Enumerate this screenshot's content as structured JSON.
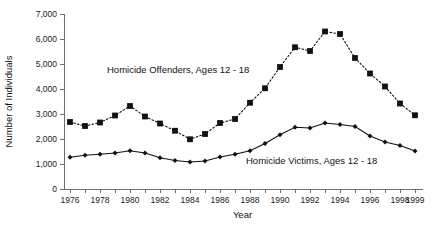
{
  "chart_data": {
    "type": "line",
    "title": "",
    "xlabel": "Year",
    "ylabel": "Number of Individuals",
    "xlim": [
      1976,
      1999
    ],
    "ylim": [
      0,
      7000
    ],
    "grid": false,
    "legend_position": "inline-annotation",
    "x": [
      1976,
      1977,
      1978,
      1979,
      1980,
      1981,
      1982,
      1983,
      1984,
      1985,
      1986,
      1987,
      1988,
      1989,
      1990,
      1991,
      1992,
      1993,
      1994,
      1995,
      1996,
      1997,
      1998,
      1999
    ],
    "x_tick_labels": [
      "1976",
      "1978",
      "1980",
      "1982",
      "1984",
      "1986",
      "1988",
      "1990",
      "1992",
      "1994",
      "1996",
      "1998",
      "1999"
    ],
    "x_ticks": [
      1976,
      1978,
      1980,
      1982,
      1984,
      1986,
      1988,
      1990,
      1992,
      1994,
      1996,
      1998,
      1999
    ],
    "y_ticks": [
      0,
      1000,
      2000,
      3000,
      4000,
      5000,
      6000,
      7000
    ],
    "y_tick_labels": [
      "0",
      "1,000",
      "2,000",
      "3,000",
      "4,000",
      "5,000",
      "6,000",
      "7,000"
    ],
    "series": [
      {
        "name": "Homicide Offenders, Ages 12 - 18",
        "marker": "square",
        "linestyle": "dotted",
        "color": "#111111",
        "annotation": "Homicide Offenders, Ages 12 - 18",
        "values": [
          2680,
          2520,
          2660,
          2940,
          3320,
          2900,
          2620,
          2330,
          1990,
          2200,
          2640,
          2800,
          3450,
          4030,
          4880,
          5670,
          5520,
          6300,
          6200,
          5240,
          4620,
          4100,
          3420,
          2950
        ]
      },
      {
        "name": "Homicide Victims, Ages 12 - 18",
        "marker": "diamond",
        "linestyle": "solid",
        "color": "#111111",
        "annotation": "Homicide Victims, Ages 12 - 18",
        "values": [
          1270,
          1350,
          1390,
          1440,
          1530,
          1440,
          1250,
          1140,
          1080,
          1120,
          1280,
          1390,
          1530,
          1820,
          2170,
          2470,
          2440,
          2640,
          2580,
          2500,
          2120,
          1880,
          1740,
          1520
        ]
      }
    ],
    "annotations": [
      {
        "text": "Homicide Offenders, Ages 12 - 18",
        "x_px": 107,
        "y_px": 73
      },
      {
        "text": "Homicide Victims, Ages 12 - 18",
        "x_px": 246,
        "y_px": 164
      }
    ]
  }
}
